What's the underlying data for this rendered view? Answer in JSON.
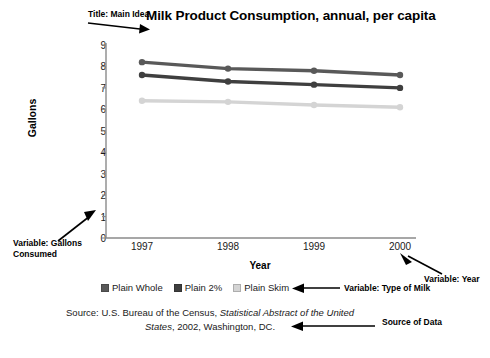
{
  "chart_data": {
    "type": "line",
    "title": "Milk Product Consumption, annual, per capita",
    "xlabel": "Year",
    "ylabel": "Gallons",
    "categories": [
      "1997",
      "1998",
      "1999",
      "2000"
    ],
    "ylim": [
      0,
      9
    ],
    "yticks": [
      0,
      1,
      2,
      3,
      4,
      5,
      6,
      7,
      8,
      9
    ],
    "grid": false,
    "legend_position": "bottom",
    "series": [
      {
        "name": "Plain Whole",
        "values": [
          8.2,
          7.9,
          7.8,
          7.6
        ],
        "color": "#595959"
      },
      {
        "name": "Plain 2%",
        "values": [
          7.6,
          7.3,
          7.15,
          7.0
        ],
        "color": "#3f3f3f"
      },
      {
        "name": "Plain Skim",
        "values": [
          6.4,
          6.35,
          6.2,
          6.1
        ],
        "color": "#d4d4d4"
      }
    ]
  },
  "annotations": {
    "title_callout": "Title: Main Idea",
    "y_variable_callout": "Variable: Gallons\nConsumed",
    "x_variable_callout": "Variable: Year",
    "series_variable_callout": "Variable: Type of Milk",
    "source_callout": "Source of Data"
  },
  "source": {
    "prefix": "Source: U.S. Bureau of the Census, ",
    "italic": "Statistical Abstract of the United States",
    "suffix": ", 2002, Washington, DC."
  }
}
